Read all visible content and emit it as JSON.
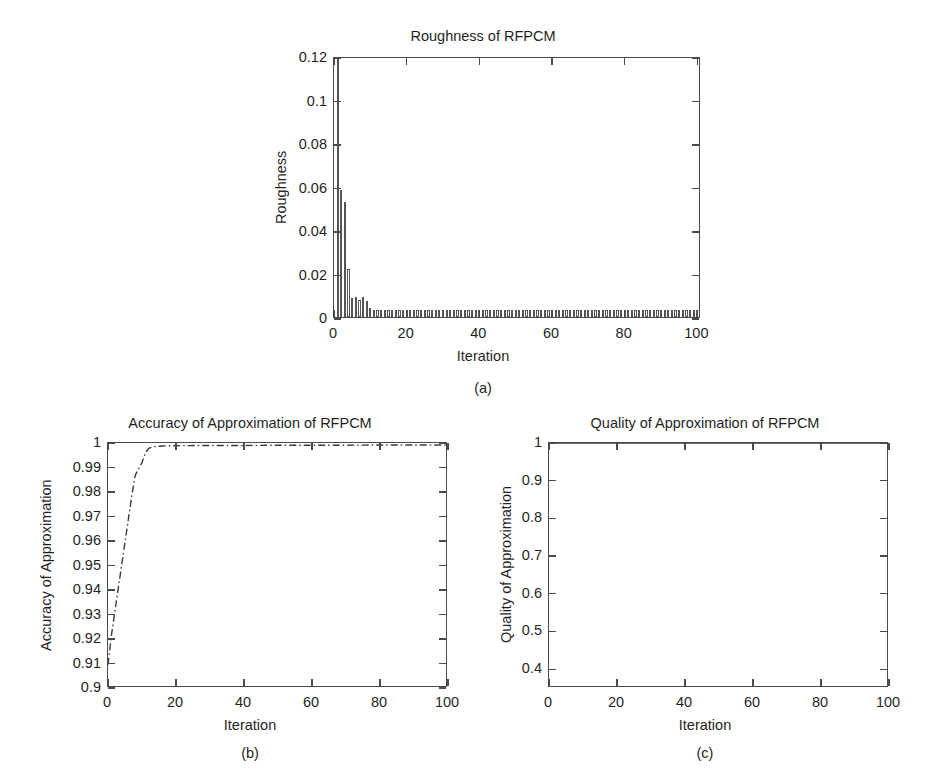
{
  "figure": {
    "background": "#ffffff",
    "line_color": "#3b3b3b",
    "axis_color": "#4a4a4a",
    "bar_edge_color": "#555555",
    "bar_fill_color": "#ffffff"
  },
  "chart_data": [
    {
      "id": "panel-a",
      "type": "bar",
      "title": "Roughness of RFPCM",
      "xlabel": "Iteration",
      "ylabel": "Roughness",
      "caption": "(a)",
      "xlim": [
        0,
        101
      ],
      "ylim": [
        0,
        0.12
      ],
      "xticks": [
        0,
        20,
        40,
        60,
        80,
        100
      ],
      "xtick_labels": [
        "0",
        "20",
        "40",
        "60",
        "80",
        "100"
      ],
      "yticks": [
        0,
        0.02,
        0.04,
        0.06,
        0.08,
        0.1,
        0.12
      ],
      "ytick_labels": [
        "0",
        "0.02",
        "0.04",
        "0.06",
        "0.08",
        "0.1",
        "0.12"
      ],
      "grid": false,
      "legend": "none",
      "x": [
        1,
        2,
        3,
        4,
        5,
        6,
        7,
        8,
        9,
        10,
        11,
        12,
        13,
        14,
        15,
        16,
        17,
        18,
        19,
        20,
        21,
        22,
        23,
        24,
        25,
        26,
        27,
        28,
        29,
        30,
        31,
        32,
        33,
        34,
        35,
        36,
        37,
        38,
        39,
        40,
        41,
        42,
        43,
        44,
        45,
        46,
        47,
        48,
        49,
        50,
        51,
        52,
        53,
        54,
        55,
        56,
        57,
        58,
        59,
        60,
        61,
        62,
        63,
        64,
        65,
        66,
        67,
        68,
        69,
        70,
        71,
        72,
        73,
        74,
        75,
        76,
        77,
        78,
        79,
        80,
        81,
        82,
        83,
        84,
        85,
        86,
        87,
        88,
        89,
        90,
        91,
        92,
        93,
        94,
        95,
        96,
        97,
        98,
        99,
        100
      ],
      "values": [
        0.1192,
        0.0582,
        0.0528,
        0.0222,
        0.0088,
        0.0092,
        0.008,
        0.009,
        0.0072,
        0.004,
        0.0032,
        0.0031,
        0.003,
        0.003,
        0.003,
        0.003,
        0.003,
        0.003,
        0.003,
        0.003,
        0.003,
        0.003,
        0.003,
        0.003,
        0.003,
        0.003,
        0.003,
        0.003,
        0.003,
        0.003,
        0.003,
        0.003,
        0.003,
        0.003,
        0.003,
        0.003,
        0.003,
        0.003,
        0.003,
        0.003,
        0.003,
        0.003,
        0.003,
        0.003,
        0.003,
        0.003,
        0.003,
        0.003,
        0.003,
        0.003,
        0.003,
        0.003,
        0.003,
        0.003,
        0.003,
        0.003,
        0.003,
        0.003,
        0.003,
        0.003,
        0.003,
        0.003,
        0.003,
        0.003,
        0.003,
        0.003,
        0.003,
        0.003,
        0.003,
        0.003,
        0.003,
        0.003,
        0.003,
        0.003,
        0.003,
        0.003,
        0.003,
        0.003,
        0.003,
        0.003,
        0.003,
        0.003,
        0.003,
        0.003,
        0.003,
        0.003,
        0.003,
        0.003,
        0.003,
        0.003,
        0.003,
        0.003,
        0.003,
        0.003,
        0.003,
        0.003,
        0.003,
        0.003,
        0.003,
        0.003
      ]
    },
    {
      "id": "panel-b",
      "type": "line",
      "title": "Accuracy of Approximation of RFPCM",
      "xlabel": "Iteration",
      "ylabel": "Accuracy of Approximation",
      "caption": "(b)",
      "line_style": "dash-dot",
      "xlim": [
        0,
        100
      ],
      "ylim": [
        0.9,
        1.0
      ],
      "xticks": [
        0,
        20,
        40,
        60,
        80,
        100
      ],
      "xtick_labels": [
        "0",
        "20",
        "40",
        "60",
        "80",
        "100"
      ],
      "yticks": [
        0.9,
        0.91,
        0.92,
        0.93,
        0.94,
        0.95,
        0.96,
        0.97,
        0.98,
        0.99,
        1
      ],
      "ytick_labels": [
        "0.9",
        "0.91",
        "0.92",
        "0.93",
        "0.94",
        "0.95",
        "0.96",
        "0.97",
        "0.98",
        "0.99",
        "1"
      ],
      "grid": false,
      "legend": "none",
      "x": [
        0,
        1,
        2,
        3,
        4,
        5,
        6,
        7,
        8,
        9,
        10,
        11,
        12,
        13,
        14,
        16,
        20,
        30,
        40,
        50,
        60,
        70,
        80,
        90,
        100
      ],
      "values": [
        0.9095,
        0.9215,
        0.931,
        0.9405,
        0.95,
        0.9595,
        0.969,
        0.9785,
        0.9868,
        0.9895,
        0.992,
        0.996,
        0.9978,
        0.9984,
        0.9986,
        0.9988,
        0.9989,
        0.999,
        0.999,
        0.9991,
        0.9991,
        0.9991,
        0.9992,
        0.9992,
        0.9992
      ]
    },
    {
      "id": "panel-c",
      "type": "line",
      "title": "Quality of Approximation of RFPCM",
      "xlabel": "Iteration",
      "ylabel": "Quality of Approximation",
      "caption": "(c)",
      "line_style": "solid",
      "xlim": [
        0,
        100
      ],
      "ylim": [
        0.35,
        1.0
      ],
      "xticks": [
        0,
        20,
        40,
        60,
        80,
        100
      ],
      "xtick_labels": [
        "0",
        "20",
        "40",
        "60",
        "80",
        "100"
      ],
      "yticks": [
        0.4,
        0.5,
        0.6,
        0.7,
        0.8,
        0.9,
        1
      ],
      "ytick_labels": [
        "0.4",
        "0.5",
        "0.6",
        "0.7",
        "0.8",
        "0.9",
        "1"
      ],
      "grid": false,
      "legend": "none",
      "x": [
        0,
        10,
        20,
        30,
        40,
        50,
        60,
        70,
        80,
        90,
        100
      ],
      "values": [
        1,
        1,
        1,
        1,
        1,
        1,
        1,
        1,
        1,
        1,
        1
      ]
    }
  ]
}
